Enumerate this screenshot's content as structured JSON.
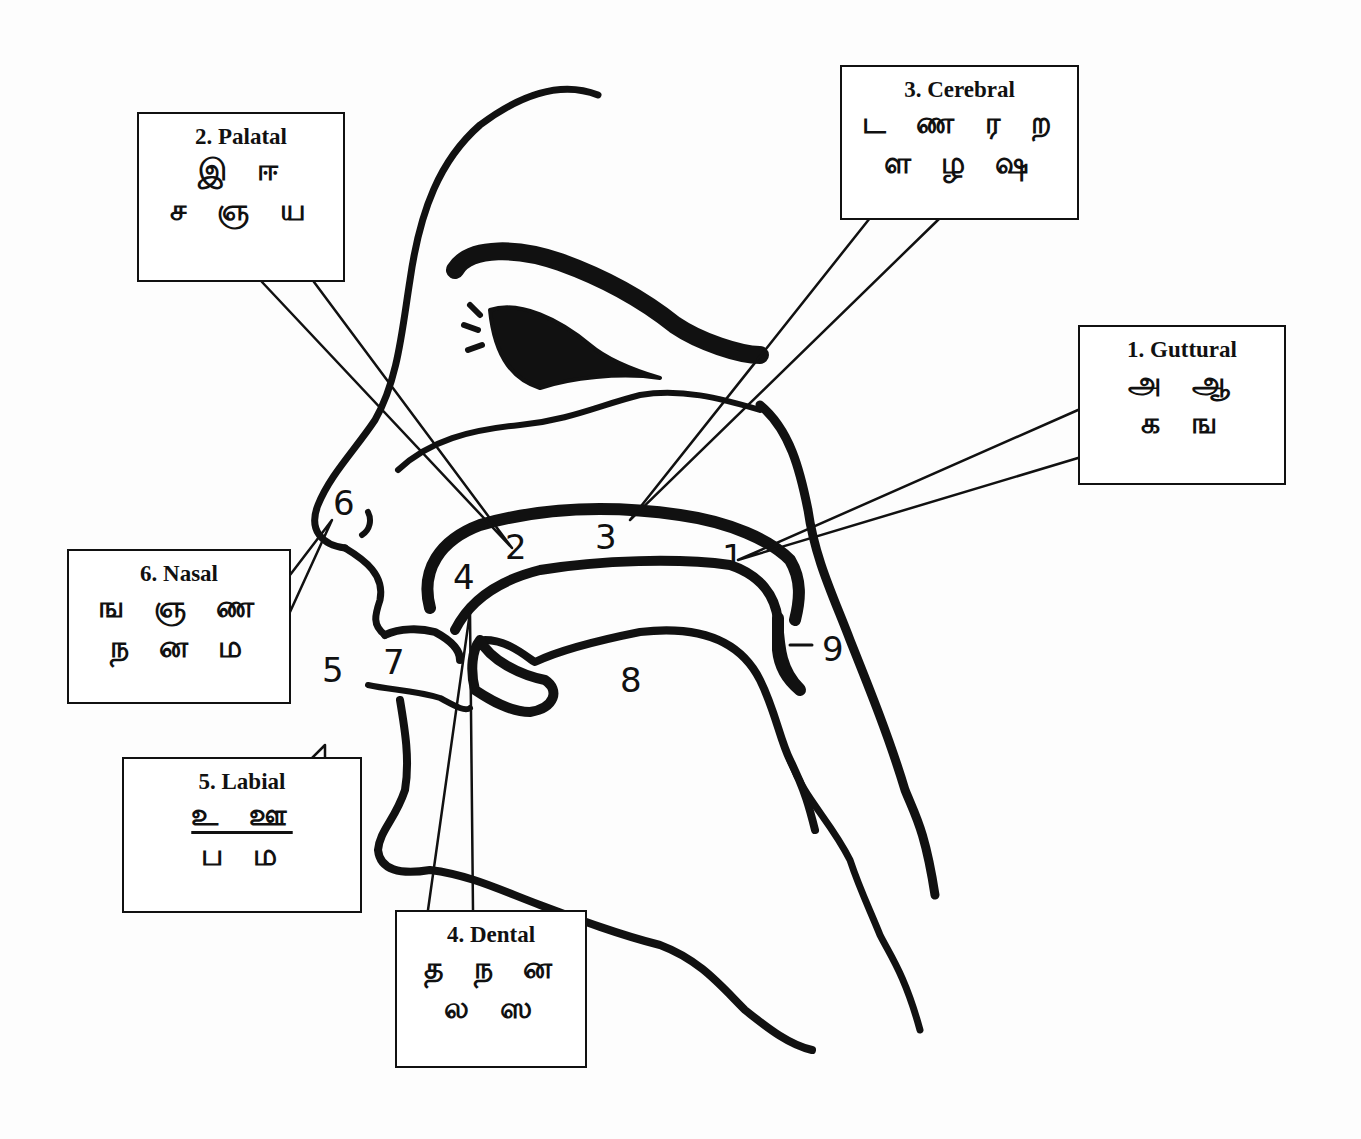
{
  "diagram": {
    "callouts": [
      {
        "id": "guttural",
        "title": "1. Guttural",
        "rows": [
          "அ ஆ",
          "க ங"
        ],
        "points_to": "1"
      },
      {
        "id": "palatal",
        "title": "2. Palatal",
        "rows": [
          "இ ஈ",
          "ச ஞ ய"
        ],
        "points_to": "2"
      },
      {
        "id": "cerebral",
        "title": "3. Cerebral",
        "rows": [
          "ட ண ர ற",
          "ள ழ ஷ"
        ],
        "points_to": "3"
      },
      {
        "id": "dental",
        "title": "4. Dental",
        "rows": [
          "த ந ன",
          "ல ஸ"
        ],
        "points_to": "4"
      },
      {
        "id": "labial",
        "title": "5. Labial",
        "rows": [
          "உ ஊ",
          "ப ம"
        ],
        "points_to": "5",
        "first_row_underlined": true
      },
      {
        "id": "nasal",
        "title": "6. Nasal",
        "rows": [
          "ங ஞ ண",
          "ந ன ம"
        ],
        "points_to": "6"
      }
    ],
    "markers": [
      {
        "label": "1",
        "meaning": "soft palate / velum"
      },
      {
        "label": "2",
        "meaning": "hard palate"
      },
      {
        "label": "3",
        "meaning": "roof of mouth (cerebral)"
      },
      {
        "label": "4",
        "meaning": "teeth"
      },
      {
        "label": "5",
        "meaning": "lips"
      },
      {
        "label": "6",
        "meaning": "nose"
      },
      {
        "label": "7",
        "meaning": "mouth opening"
      },
      {
        "label": "8",
        "meaning": "tongue"
      },
      {
        "label": "9",
        "meaning": "uvula"
      }
    ],
    "colors": {
      "ink": "#111111",
      "paper": "#fdfdfd",
      "box_fill": "#ffffff"
    }
  }
}
